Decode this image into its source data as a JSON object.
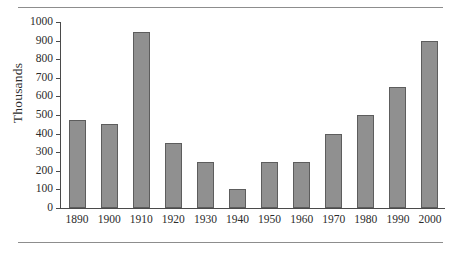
{
  "chart_data": {
    "type": "bar",
    "title": "",
    "xlabel": "",
    "ylabel": "Thousands",
    "categories": [
      "1890",
      "1900",
      "1910",
      "1920",
      "1930",
      "1940",
      "1950",
      "1960",
      "1970",
      "1980",
      "1990",
      "2000"
    ],
    "values": [
      475,
      450,
      945,
      350,
      250,
      100,
      250,
      250,
      400,
      500,
      650,
      900
    ],
    "ylim": [
      0,
      1000
    ],
    "yticks": [
      0,
      100,
      200,
      300,
      400,
      500,
      600,
      700,
      800,
      900,
      1000
    ],
    "ytick_labels": [
      "0",
      "100",
      "200",
      "300",
      "400",
      "500",
      "600",
      "700",
      "800",
      "900",
      "1000"
    ],
    "grid": false,
    "legend": null,
    "bar_color": "#909090",
    "bar_border_color": "#5d5d5d",
    "axis_color": "#4a4a4a",
    "rule_color": "#8d8d8d",
    "background": "#ffffff"
  }
}
